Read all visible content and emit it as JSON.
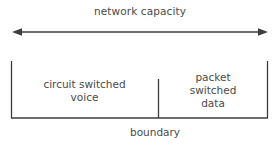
{
  "diagram": {
    "title": "network capacity",
    "caption": "boundary",
    "stroke_color": "#3c3c3c",
    "text_color": "#4a4a4a",
    "background_color": "#ffffff",
    "arrow": {
      "name": "double-headed-arrow",
      "left_head": "◀",
      "right_head": "▶",
      "x_start": 12,
      "x_end": 268,
      "y": 10
    },
    "box": {
      "x_left": 11,
      "x_right": 268,
      "y_top": 6,
      "y_bottom": 63,
      "divider_x": 158,
      "divider_y_top": 24,
      "has_top_edge": false
    },
    "sections": [
      {
        "id": "circuit-switched-voice",
        "label": "circuit switched\nvoice",
        "line1": "circuit switched",
        "line2": "voice"
      },
      {
        "id": "packet-switched-data",
        "label": "packet\nswitched\ndata",
        "line1": "packet",
        "line2": "switched",
        "line3": "data"
      }
    ]
  }
}
